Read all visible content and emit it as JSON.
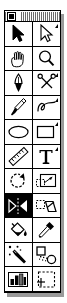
{
  "window": {
    "title": "",
    "kind": "floating-tool-palette",
    "close_box": "close-box",
    "width": 67,
    "height": 303,
    "colors": {
      "background": "#ffffff",
      "ink": "#000000",
      "shadow": "#9a9a9a",
      "selected_background": "#000000",
      "selected_ink": "#ffffff"
    }
  },
  "palette": {
    "columns": 2,
    "rows": 11,
    "selected_tool_id": "flip",
    "tools": [
      {
        "id": "arrow",
        "label": "Selection Arrow",
        "icon": "arrow-pointer-icon",
        "selected": false,
        "has_options": false
      },
      {
        "id": "reshape",
        "label": "Reshape Arrow",
        "icon": "arrow-reshape-icon",
        "selected": false,
        "has_options": true
      },
      {
        "id": "hand",
        "label": "Hand",
        "icon": "hand-icon",
        "selected": false,
        "has_options": false
      },
      {
        "id": "zoom",
        "label": "Magnifier",
        "icon": "magnifier-icon",
        "selected": false,
        "has_options": false
      },
      {
        "id": "pen",
        "label": "Pen",
        "icon": "pen-nib-icon",
        "selected": false,
        "has_options": false
      },
      {
        "id": "scissors",
        "label": "Scissors",
        "icon": "scissors-icon",
        "selected": false,
        "has_options": true
      },
      {
        "id": "brush",
        "label": "Paintbrush",
        "icon": "paintbrush-icon",
        "selected": false,
        "has_options": false
      },
      {
        "id": "freehand",
        "label": "Freehand Line",
        "icon": "freehand-curve-icon",
        "selected": false,
        "has_options": true
      },
      {
        "id": "ellipse",
        "label": "Ellipse",
        "icon": "ellipse-icon",
        "selected": false,
        "has_options": false
      },
      {
        "id": "rectangle",
        "label": "Rectangle",
        "icon": "rectangle-icon",
        "selected": false,
        "has_options": true
      },
      {
        "id": "ruler",
        "label": "Ruler",
        "icon": "ruler-icon",
        "selected": false,
        "has_options": false
      },
      {
        "id": "text",
        "label": "Text",
        "icon": "text-t-icon",
        "selected": false,
        "has_options": true
      },
      {
        "id": "rotate",
        "label": "Rotate",
        "icon": "rotate-arrow-icon",
        "selected": false,
        "has_options": false
      },
      {
        "id": "crop",
        "label": "Crop / Resize",
        "icon": "crop-resize-icon",
        "selected": false,
        "has_options": false
      },
      {
        "id": "flip",
        "label": "Flip / Mirror",
        "icon": "flip-mirror-icon",
        "selected": true,
        "has_options": false
      },
      {
        "id": "skew",
        "label": "Skew / Slant",
        "icon": "skew-parallelogram-icon",
        "selected": false,
        "has_options": false
      },
      {
        "id": "bucket",
        "label": "Paint Bucket",
        "icon": "paint-bucket-icon",
        "selected": false,
        "has_options": false
      },
      {
        "id": "eyedropper",
        "label": "Eyedropper",
        "icon": "eyedropper-icon",
        "selected": false,
        "has_options": false
      },
      {
        "id": "wand",
        "label": "Magic Wand",
        "icon": "magic-wand-icon",
        "selected": false,
        "has_options": false
      },
      {
        "id": "blend",
        "label": "Blend / Morph",
        "icon": "blend-shapes-icon",
        "selected": false,
        "has_options": false
      },
      {
        "id": "gradient",
        "label": "Gradient / Chart",
        "icon": "bar-chart-icon",
        "selected": false,
        "has_options": false
      },
      {
        "id": "marquee",
        "label": "Selection Marquee",
        "icon": "dashed-marquee-icon",
        "selected": false,
        "has_options": false
      }
    ]
  }
}
